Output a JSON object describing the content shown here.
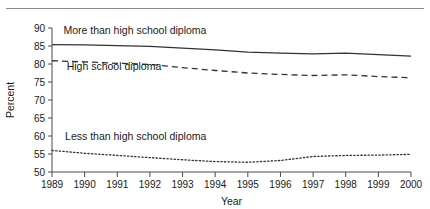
{
  "figure": {
    "has_top_rule": true,
    "background": "#ffffff",
    "line_color": "#333333",
    "axis_color": "#4a4a4a"
  },
  "chart_data": {
    "type": "line",
    "title": "",
    "xlabel": "Year",
    "ylabel": "Percent",
    "xlim": [
      1989,
      2000
    ],
    "ylim": [
      50,
      90
    ],
    "grid": false,
    "legend_position": "inline-annotation",
    "x": [
      1989,
      1990,
      1991,
      1992,
      1993,
      1994,
      1995,
      1996,
      1997,
      1998,
      1999,
      2000
    ],
    "xticklabels": [
      "1989",
      "1990",
      "1991",
      "1992",
      "1993",
      "1994",
      "1995",
      "1996",
      "1997",
      "1998",
      "1999",
      "2000"
    ],
    "yticks": [
      50,
      55,
      60,
      65,
      70,
      75,
      80,
      85,
      90
    ],
    "yticklabels": [
      "50",
      "55",
      "60",
      "65",
      "70",
      "75",
      "80",
      "85",
      "90"
    ],
    "series": [
      {
        "name": "More than high school diploma",
        "style": "solid",
        "label_x": 1989.35,
        "label_y": 88.2,
        "values": [
          85.4,
          85.3,
          85.1,
          84.9,
          84.4,
          83.9,
          83.3,
          83.0,
          82.8,
          83.0,
          82.6,
          82.2
        ]
      },
      {
        "name": "High school diploma",
        "style": "dashed",
        "label_x": 1989.45,
        "label_y": 78.3,
        "values": [
          80.9,
          80.6,
          80.2,
          79.9,
          79.0,
          78.2,
          77.5,
          77.1,
          76.8,
          77.0,
          76.5,
          76.2
        ]
      },
      {
        "name": "Less than high school diploma",
        "style": "dotted",
        "label_x": 1989.4,
        "label_y": 59.0,
        "values": [
          56.0,
          55.2,
          54.6,
          54.0,
          53.4,
          52.9,
          52.7,
          53.2,
          54.3,
          54.6,
          54.7,
          54.9
        ]
      }
    ]
  }
}
